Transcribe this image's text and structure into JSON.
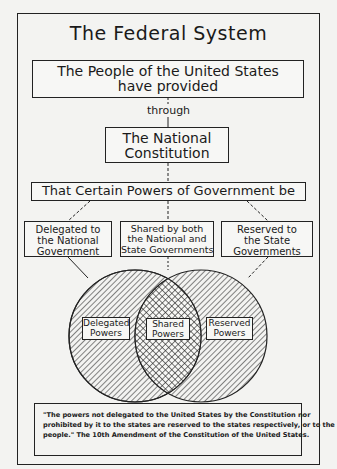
{
  "diagram": {
    "title": "The Federal System",
    "top_box": {
      "line1": "The People of the United States",
      "line2": "have provided"
    },
    "connector_label": "through",
    "constitution_box": {
      "line1": "The National",
      "line2": "Constitution"
    },
    "powers_box": "That Certain Powers of Government be",
    "branches": [
      {
        "line1": "Delegated to",
        "line2": "the National",
        "line3": "Government"
      },
      {
        "line1": "Shared by both",
        "line2": "the National and",
        "line3": "State Governments"
      },
      {
        "line1": "Reserved to",
        "line2": "the State",
        "line3": "Governments"
      }
    ],
    "venn": {
      "left": {
        "line1": "Delegated",
        "line2": "Powers"
      },
      "center": {
        "line1": "Shared",
        "line2": "Powers"
      },
      "right": {
        "line1": "Reserved",
        "line2": "Powers"
      }
    },
    "quote": {
      "line1": "\"The powers not delegated to the United States by the Constitution nor",
      "line2": "prohibited by it to the states are reserved to the states respectively, or to the",
      "line3": "people.\"   The 10th Amendment of the Constitution of the United States."
    }
  }
}
